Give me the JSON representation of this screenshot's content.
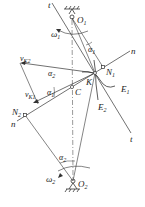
{
  "diagram": {
    "type": "gear-meshing-kinematics",
    "labels": {
      "O1": "O",
      "O1_sub": "1",
      "O2": "O",
      "O2_sub": "2",
      "omega1": "ω",
      "omega1_sub": "1",
      "omega2": "ω",
      "omega2_sub": "2",
      "alpha1_top": "α",
      "alpha1_top_sub": "1",
      "alpha1_left": "α",
      "alpha1_left_sub": "1",
      "alpha2_mid": "α",
      "alpha2_mid_sub": "2",
      "alpha2_bottom": "α",
      "alpha2_bottom_sub": "2",
      "vK2": "v",
      "vK2_sub": "K2",
      "vK1": "v",
      "vK1_sub": "K1",
      "N1": "N",
      "N1_sub": "1",
      "N2": "N",
      "N2_sub": "2",
      "K": "K",
      "C": "C",
      "E1": "E",
      "E1_sub": "1",
      "E2": "E",
      "E2_sub": "2",
      "n_top": "n",
      "n_bottom": "n",
      "t_top": "t",
      "t_bottom": "t"
    },
    "points": {
      "O1": [
        72,
        18
      ],
      "O2": [
        73,
        181
      ],
      "K": [
        95,
        73
      ],
      "N1": [
        103,
        67
      ],
      "N2": [
        25,
        115
      ],
      "C": [
        72,
        87
      ]
    },
    "colors": {
      "line": "#333333",
      "background": "#ffffff"
    }
  }
}
